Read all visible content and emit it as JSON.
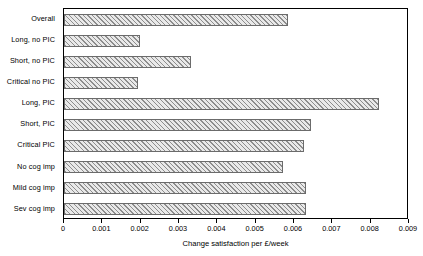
{
  "chart_data": {
    "type": "bar",
    "orientation": "horizontal",
    "title": "",
    "xlabel": "Change satisfaction per £/week",
    "ylabel": "",
    "categories": [
      "Overall",
      "Long, no PIC",
      "Short, no PIC",
      "Critical no PIC",
      "Long, PIC",
      "Short, PIC",
      "Critical PIC",
      "No cog imp",
      "Mild cog imp",
      "Sev cog imp"
    ],
    "values": [
      0.00585,
      0.00198,
      0.0033,
      0.00193,
      0.00822,
      0.00645,
      0.00627,
      0.00572,
      0.0063,
      0.0063
    ],
    "xlim": [
      0,
      0.009
    ],
    "xticks": [
      0,
      0.001,
      0.002,
      0.003,
      0.004,
      0.005,
      0.006,
      0.007,
      0.008,
      0.009
    ],
    "xtick_labels": [
      "0",
      "0.001",
      "0.002",
      "0.003",
      "0.004",
      "0.005",
      "0.006",
      "0.007",
      "0.008",
      "0.009"
    ],
    "grid": false,
    "legend": null,
    "bar_fill": "#e9e9e9",
    "bar_hatch": "diagonal-forward",
    "bar_edge_color": "#6b6b6b",
    "frame_color": "#000000",
    "background": "#ffffff"
  }
}
